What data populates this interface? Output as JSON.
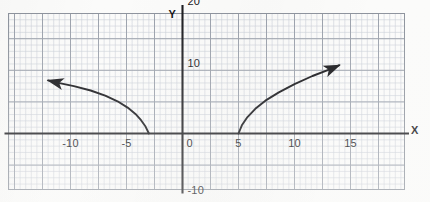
{
  "chart_data": {
    "type": "line",
    "title": "",
    "xlabel": "X",
    "ylabel": "Y",
    "xlim": [
      -14,
      20
    ],
    "ylim": [
      -11.5,
      21
    ],
    "grid": true,
    "grid_major_step_x": 2.5,
    "grid_major_step_y": 5,
    "grid_minor_per_major": 5,
    "legend": "none",
    "x_tick_labels": [
      "-10",
      "-5",
      "0",
      "5",
      "10",
      "15"
    ],
    "x_tick_values": [
      -10,
      -5,
      0,
      5,
      10,
      15
    ],
    "y_tick_labels": [
      "20",
      "10",
      "-10"
    ],
    "y_tick_values": [
      20,
      10,
      -10
    ],
    "origin_label": "0",
    "series": [
      {
        "name": "left-branch",
        "comment": "reflected square-root curve, opens up-left from (-3, 0)",
        "arrow": "end",
        "x": [
          -3.0,
          -3.3,
          -3.7,
          -4.2,
          -4.9,
          -5.8,
          -6.9,
          -8.2,
          -9.7,
          -11.3,
          -12.0
        ],
        "y": [
          0.0,
          1.1,
          2.1,
          3.1,
          4.1,
          5.1,
          6.0,
          6.8,
          7.5,
          8.1,
          8.4
        ]
      },
      {
        "name": "right-branch",
        "comment": "square-root curve, opens up-right from (5, 0)",
        "arrow": "end",
        "x": [
          5.0,
          5.3,
          5.8,
          6.5,
          7.4,
          8.6,
          10.0,
          11.6,
          13.2,
          14.0
        ],
        "y": [
          0.0,
          1.3,
          2.6,
          3.9,
          5.2,
          6.5,
          7.8,
          9.1,
          10.2,
          10.8
        ]
      }
    ],
    "colors": {
      "curve": "#101014",
      "axis": "#1a1a1e",
      "grid_major": "#9aa0ab",
      "grid_minor": "#c9ced6",
      "grid_frame": "#8c929c",
      "background": "#fbfbfa"
    }
  },
  "axes": {
    "x_name": "X",
    "y_name": "Y"
  }
}
